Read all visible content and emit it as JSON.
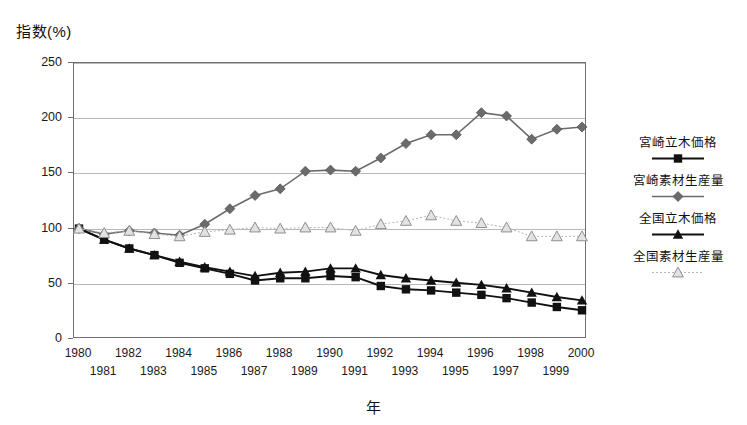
{
  "axes": {
    "y_caption": "指数(%)",
    "x_caption": "年",
    "y_ticks": [
      "0",
      "50",
      "100",
      "150",
      "200",
      "250"
    ],
    "x_ticks": [
      "1980",
      "1981",
      "1982",
      "1983",
      "1984",
      "1985",
      "1986",
      "1987",
      "1988",
      "1989",
      "1990",
      "1991",
      "1992",
      "1993",
      "1994",
      "1995",
      "1996",
      "1997",
      "1998",
      "1999",
      "2000"
    ]
  },
  "legend": {
    "entries": [
      {
        "label": "宮崎立木価格",
        "marker": "square-marker",
        "color": "#111111"
      },
      {
        "label": "宮崎素材生産量",
        "marker": "diamond-marker",
        "color": "#6b6b6b"
      },
      {
        "label": "全国立木価格",
        "marker": "triangle-marker",
        "color": "#111111"
      },
      {
        "label": "全国素材生産量",
        "marker": "open-triangle-marker",
        "color": "#a9a9a9"
      }
    ]
  },
  "chart_data": {
    "type": "line",
    "title": "",
    "xlabel": "年",
    "ylabel": "指数(%)",
    "ylim": [
      0,
      250
    ],
    "ytick_step": 50,
    "grid": true,
    "legend_position": "right",
    "x": [
      1980,
      1981,
      1982,
      1983,
      1984,
      1985,
      1986,
      1987,
      1988,
      1989,
      1990,
      1991,
      1992,
      1993,
      1994,
      1995,
      1996,
      1997,
      1998,
      1999,
      2000
    ],
    "series": [
      {
        "name": "宮崎立木価格",
        "color": "#111111",
        "marker": "square",
        "values": [
          100,
          90,
          82,
          76,
          69,
          64,
          59,
          53,
          55,
          55,
          57,
          56,
          48,
          45,
          44,
          42,
          40,
          37,
          33,
          29,
          26
        ]
      },
      {
        "name": "宮崎素材生産量",
        "color": "#6b6b6b",
        "marker": "diamond",
        "values": [
          100,
          95,
          98,
          96,
          94,
          104,
          118,
          130,
          136,
          152,
          153,
          152,
          164,
          177,
          185,
          185,
          205,
          202,
          181,
          190,
          192
        ]
      },
      {
        "name": "全国立木価格",
        "color": "#111111",
        "marker": "triangle",
        "values": [
          100,
          90,
          82,
          76,
          70,
          65,
          61,
          57,
          60,
          61,
          64,
          64,
          58,
          55,
          53,
          51,
          49,
          46,
          42,
          38,
          35
        ]
      },
      {
        "name": "全国素材生産量",
        "color": "#a9a9a9",
        "marker": "open-triangle",
        "values": [
          100,
          96,
          98,
          95,
          93,
          97,
          99,
          101,
          100,
          101,
          101,
          98,
          104,
          107,
          112,
          107,
          105,
          101,
          93,
          93,
          93
        ]
      }
    ]
  }
}
